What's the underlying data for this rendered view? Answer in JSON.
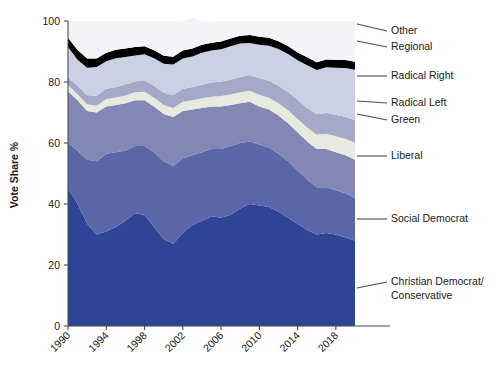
{
  "chart_data": {
    "type": "area",
    "stacked": true,
    "normalized": true,
    "title": "",
    "subtitle": "",
    "xlabel": "",
    "ylabel": "Vote Share %",
    "ylim": [
      0,
      100
    ],
    "xlim": [
      1990,
      2020
    ],
    "grid": false,
    "legend_position": "right-leader-lines",
    "x": [
      1990,
      1991,
      1992,
      1993,
      1994,
      1995,
      1996,
      1997,
      1998,
      1999,
      2000,
      2001,
      2002,
      2003,
      2004,
      2005,
      2006,
      2007,
      2008,
      2009,
      2010,
      2011,
      2012,
      2013,
      2014,
      2015,
      2016,
      2017,
      2018,
      2019,
      2020
    ],
    "xtick_labels": [
      "1990",
      "1994",
      "1998",
      "2002",
      "2006",
      "2010",
      "2014",
      "2018"
    ],
    "xtick_values": [
      1990,
      1994,
      1998,
      2002,
      2006,
      2010,
      2014,
      2018
    ],
    "ytick_labels": [
      "0",
      "20",
      "40",
      "60",
      "80",
      "100"
    ],
    "ytick_values": [
      0,
      20,
      40,
      60,
      80,
      100
    ],
    "categories": [
      "1990",
      "1991",
      "1992",
      "1993",
      "1994",
      "1995",
      "1996",
      "1997",
      "1998",
      "1999",
      "2000",
      "2001",
      "2002",
      "2003",
      "2004",
      "2005",
      "2006",
      "2007",
      "2008",
      "2009",
      "2010",
      "2011",
      "2012",
      "2013",
      "2014",
      "2015",
      "2016",
      "2017",
      "2018",
      "2019",
      "2020"
    ],
    "series": [
      {
        "name": "Christian Democrat/Conservative",
        "color": "#2e4494",
        "values": [
          45.0,
          40.0,
          33.5,
          30.0,
          31.0,
          32.5,
          34.5,
          37.0,
          36.5,
          32.5,
          28.5,
          27.0,
          30.5,
          33.0,
          34.5,
          36.0,
          35.5,
          36.5,
          38.5,
          40.0,
          39.5,
          39.0,
          37.5,
          35.5,
          33.5,
          31.5,
          30.0,
          30.5,
          30.0,
          29.0,
          28.0
        ]
      },
      {
        "name": "Social Democrat",
        "color": "#5b66a8",
        "values": [
          15.0,
          17.5,
          21.0,
          24.0,
          25.5,
          24.5,
          23.0,
          22.0,
          22.5,
          24.5,
          25.5,
          25.5,
          24.5,
          23.0,
          22.5,
          22.0,
          22.5,
          22.5,
          21.5,
          20.5,
          20.0,
          19.5,
          19.0,
          18.5,
          17.5,
          16.5,
          15.5,
          15.0,
          14.5,
          14.5,
          14.0
        ]
      },
      {
        "name": "Liberal",
        "color": "#8287b5",
        "values": [
          17.0,
          16.5,
          16.0,
          16.0,
          15.5,
          15.5,
          15.5,
          15.0,
          15.0,
          15.0,
          15.5,
          16.0,
          15.5,
          15.0,
          14.5,
          14.0,
          14.0,
          13.5,
          13.0,
          13.0,
          12.5,
          12.5,
          12.5,
          12.5,
          12.5,
          12.5,
          12.5,
          12.5,
          12.5,
          12.5,
          12.5
        ]
      },
      {
        "name": "Green",
        "color": "#e8eadf",
        "values": [
          2.0,
          2.0,
          2.2,
          2.2,
          2.4,
          2.4,
          2.6,
          2.6,
          2.8,
          2.8,
          3.0,
          3.0,
          3.0,
          3.0,
          3.2,
          3.2,
          3.4,
          3.4,
          3.6,
          3.6,
          3.8,
          3.8,
          4.0,
          4.2,
          4.4,
          4.6,
          4.8,
          5.0,
          5.2,
          5.4,
          5.6
        ]
      },
      {
        "name": "Radical Left",
        "color": "#a5a8c6",
        "values": [
          2.5,
          2.8,
          3.0,
          3.2,
          3.4,
          3.4,
          3.6,
          3.6,
          3.8,
          4.0,
          4.0,
          4.2,
          4.2,
          4.4,
          4.4,
          4.6,
          4.8,
          4.8,
          5.0,
          5.2,
          5.4,
          5.6,
          5.8,
          6.0,
          6.2,
          6.4,
          6.6,
          6.8,
          7.0,
          7.2,
          7.4
        ]
      },
      {
        "name": "Radical Right",
        "color": "#ccd0e4",
        "values": [
          10.0,
          8.5,
          9.0,
          9.5,
          9.0,
          9.5,
          9.0,
          8.5,
          8.5,
          9.0,
          9.5,
          10.0,
          10.0,
          10.0,
          10.5,
          10.5,
          10.5,
          11.0,
          11.0,
          10.5,
          11.0,
          11.5,
          12.0,
          12.5,
          13.0,
          14.0,
          14.5,
          15.0,
          15.5,
          16.0,
          16.5
        ]
      },
      {
        "name": "Regional",
        "color": "#000000",
        "values": [
          3.0,
          3.2,
          3.0,
          2.8,
          2.8,
          2.8,
          2.8,
          2.8,
          2.6,
          2.6,
          2.6,
          2.6,
          2.6,
          2.6,
          2.6,
          2.6,
          2.6,
          2.6,
          2.6,
          2.6,
          2.6,
          2.6,
          2.6,
          2.6,
          2.6,
          2.6,
          2.6,
          2.6,
          2.6,
          2.6,
          2.6
        ]
      },
      {
        "name": "Other",
        "color": "#f2f4f8",
        "values": [
          5.5,
          9.5,
          12.3,
          12.3,
          10.4,
          9.4,
          9.0,
          8.5,
          8.3,
          9.6,
          11.4,
          11.7,
          9.7,
          10.0,
          7.8,
          6.7,
          6.7,
          5.7,
          4.8,
          4.6,
          5.2,
          5.5,
          6.6,
          8.2,
          10.3,
          11.9,
          13.5,
          12.6,
          12.7,
          12.8,
          13.4
        ]
      }
    ],
    "legend_entries": [
      {
        "label": "Other",
        "color": "#f2f4f8"
      },
      {
        "label": "Regional",
        "color": "#000000"
      },
      {
        "label": "Radical Right",
        "color": "#ccd0e4"
      },
      {
        "label": "Radical Left",
        "color": "#a5a8c6"
      },
      {
        "label": "Green",
        "color": "#e8eadf"
      },
      {
        "label": "Liberal",
        "color": "#8287b5"
      },
      {
        "label": "Social Democrat",
        "color": "#5b66a8"
      },
      {
        "label": "Christian Democrat/",
        "label2": "Conservative",
        "color": "#2e4494"
      }
    ]
  },
  "legend": {
    "other": "Other",
    "regional": "Regional",
    "radical_right": "Radical Right",
    "radical_left": "Radical Left",
    "green": "Green",
    "liberal": "Liberal",
    "social_democrat": "Social Democrat",
    "christian_democrat_line1": "Christian Democrat/",
    "christian_democrat_line2": "Conservative"
  },
  "axes": {
    "y_title": "Vote Share %",
    "y_ticks": [
      "100",
      "80",
      "60",
      "40",
      "20",
      "0"
    ],
    "x_ticks": [
      "1990",
      "1994",
      "1998",
      "2002",
      "2006",
      "2010",
      "2014",
      "2018"
    ]
  }
}
